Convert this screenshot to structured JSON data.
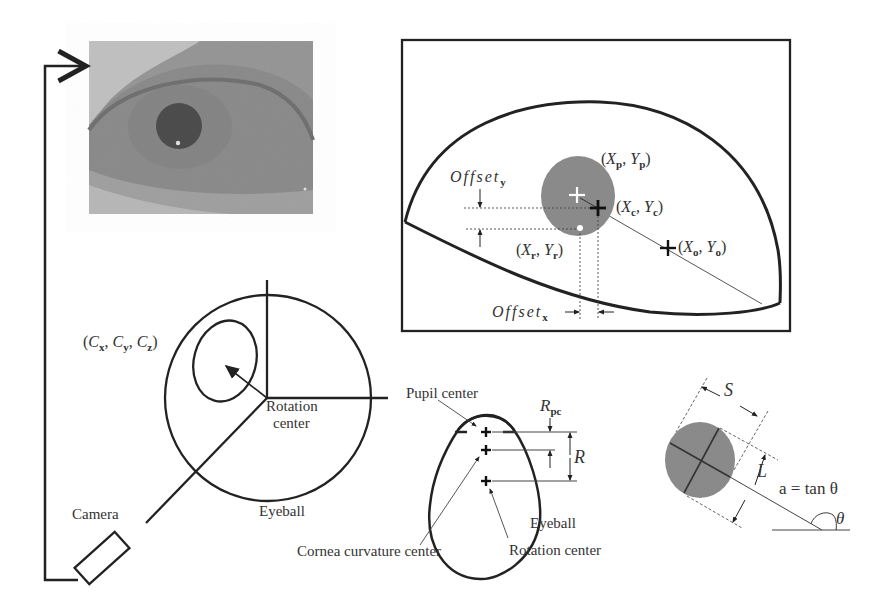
{
  "figure": {
    "eye_photo": {
      "description": "infrared eye photograph with pupil and corneal reflection"
    },
    "camera_block": {
      "camera_label": "Camera",
      "eyeball_label": "Eyeball",
      "rotation_center_line1": "Rotation",
      "rotation_center_line2": "center",
      "cornea_coord": {
        "open": "(",
        "c1": "C",
        "s1": "x",
        "c2": "C",
        "s2": "y",
        "c3": "C",
        "s3": "z",
        "close": ")"
      }
    },
    "image_panel": {
      "pupil_center": {
        "x": "X",
        "xs": "p",
        "y": "Y",
        "ys": "p"
      },
      "corneal_center": {
        "x": "X",
        "xs": "c",
        "y": "Y",
        "ys": "c"
      },
      "reflection": {
        "x": "X",
        "xs": "r",
        "y": "Y",
        "ys": "r"
      },
      "eye_center": {
        "x": "X",
        "xs": "o",
        "y": "Y",
        "ys": "o"
      },
      "offset_y": {
        "base": "Offset",
        "sub": "y"
      },
      "offset_x": {
        "base": "Offset",
        "sub": "x"
      }
    },
    "eyeball_model": {
      "pupil_center_label": "Pupil center",
      "cornea_curvature_label": "Cornea curvature center",
      "rotation_center_label": "Rotation center",
      "eyeball_label": "Eyeball",
      "r_pc": {
        "base": "R",
        "sub": "pc"
      },
      "r": "R"
    },
    "ellipse_model": {
      "s_label": "S",
      "l_label": "L",
      "equation": "a = tan θ",
      "theta": "θ"
    },
    "colors": {
      "line": "#222222",
      "pupil_fill": "#8a8a8a",
      "text": "#333333"
    }
  }
}
